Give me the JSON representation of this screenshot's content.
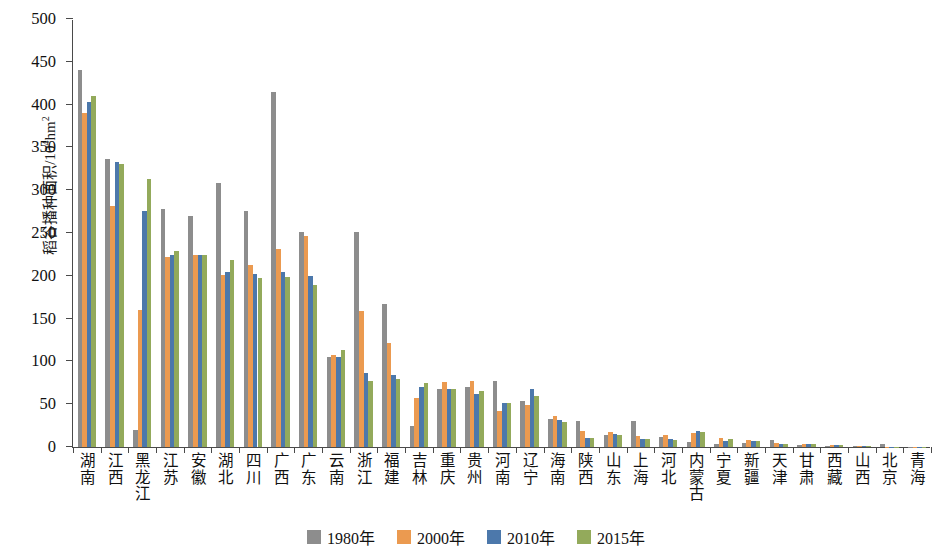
{
  "chart_data": {
    "type": "bar",
    "title": "",
    "subtitle": "",
    "xlabel": "",
    "ylabel": "稻谷播种面积/10⁴hm²",
    "ylabel_main": "稻谷播种面积/10",
    "ylabel_sup": "4",
    "ylabel_tail": "hm",
    "ylabel_tail_sup": "2",
    "ylim": [
      0,
      500
    ],
    "yticks": [
      0,
      50,
      100,
      150,
      200,
      250,
      300,
      350,
      400,
      450,
      500
    ],
    "grid": false,
    "legend_position": "bottom-center",
    "categories": [
      "湖南",
      "江西",
      "黑龙江",
      "江苏",
      "安徽",
      "湖北",
      "四川",
      "广西",
      "广东",
      "云南",
      "浙江",
      "福建",
      "吉林",
      "重庆",
      "贵州",
      "河南",
      "辽宁",
      "海南",
      "陕西",
      "山东",
      "上海",
      "河北",
      "内蒙古",
      "宁夏",
      "新疆",
      "天津",
      "甘肃",
      "西藏",
      "山西",
      "北京",
      "青海"
    ],
    "series": [
      {
        "name": "1980年",
        "color": "#8d8d8d",
        "values": [
          440,
          337,
          20,
          278,
          270,
          308,
          276,
          415,
          251,
          105,
          251,
          167,
          24,
          68,
          70,
          77,
          54,
          33,
          30,
          14,
          30,
          12,
          6,
          3,
          5,
          8,
          2,
          1,
          1,
          3,
          0.4
        ]
      },
      {
        "name": "2000年",
        "color": "#eb9a50",
        "values": [
          390,
          281,
          160,
          222,
          224,
          201,
          213,
          231,
          246,
          108,
          159,
          121,
          57,
          76,
          77,
          42,
          49,
          36,
          19,
          17,
          13,
          14,
          16,
          10,
          8,
          5,
          4,
          2,
          1,
          0.3,
          0.4
        ]
      },
      {
        "name": "2010年",
        "color": "#4c78ab",
        "values": [
          403,
          333,
          276,
          224,
          224,
          204,
          202,
          205,
          200,
          105,
          87,
          84,
          70,
          68,
          62,
          52,
          68,
          32,
          11,
          15,
          9,
          9,
          19,
          7,
          7,
          4,
          3,
          2,
          1,
          0.3,
          0.4
        ]
      },
      {
        "name": "2015年",
        "color": "#93aa5b",
        "values": [
          410,
          331,
          313,
          229,
          224,
          219,
          198,
          199,
          189,
          113,
          77,
          80,
          75,
          68,
          66,
          51,
          60,
          29,
          10,
          14,
          9,
          8,
          17,
          9,
          7,
          3,
          3,
          2,
          1,
          0.3,
          0.4
        ]
      }
    ]
  },
  "legend": {
    "items": [
      {
        "label": "1980年",
        "color": "#8d8d8d"
      },
      {
        "label": "2000年",
        "color": "#eb9a50"
      },
      {
        "label": "2010年",
        "color": "#4c78ab"
      },
      {
        "label": "2015年",
        "color": "#93aa5b"
      }
    ]
  }
}
